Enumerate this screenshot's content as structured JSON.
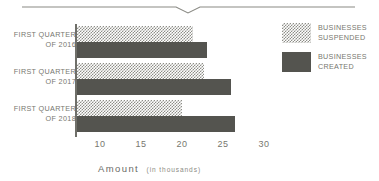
{
  "decor": {
    "top_rule": "horizontal-rule-with-notch"
  },
  "legend": {
    "items": [
      {
        "line1": "Businesses",
        "line2": "Suspended",
        "swatch": "hatched",
        "color": "#8e8e88"
      },
      {
        "line1": "Businesses",
        "line2": "Created",
        "swatch": "solid",
        "color": "#54544f"
      }
    ]
  },
  "axis": {
    "caption_main": "Amount",
    "caption_sub": "(in thousands)",
    "ticks": [
      "10",
      "15",
      "20",
      "25",
      "30"
    ]
  },
  "categories": [
    {
      "line1": "First Quarter",
      "line2": "of 2016"
    },
    {
      "line1": "First Quarter",
      "line2": "of 2017"
    },
    {
      "line1": "First Quarter",
      "line2": "of 2018"
    }
  ],
  "chart_data": {
    "type": "bar",
    "orientation": "horizontal",
    "title": "",
    "xlabel": "AMOUNT (IN THOUSANDS)",
    "ylabel": "",
    "categories": [
      "FIRST QUARTER OF 2016",
      "FIRST QUARTER OF 2017",
      "FIRST QUARTER OF 2018"
    ],
    "series": [
      {
        "name": "BUSINESSES SUSPENDED",
        "values": [
          22.3,
          23.7,
          21.0
        ],
        "color": "#8e8e88",
        "fill": "hatched"
      },
      {
        "name": "BUSINESSES CREATED",
        "values": [
          24.0,
          27.0,
          27.5
        ],
        "color": "#54544f",
        "fill": "solid"
      }
    ],
    "xlim": [
      8.2,
      35
    ],
    "xticks": [
      10,
      15,
      20,
      25,
      30
    ],
    "grid": false,
    "legend_position": "right"
  }
}
